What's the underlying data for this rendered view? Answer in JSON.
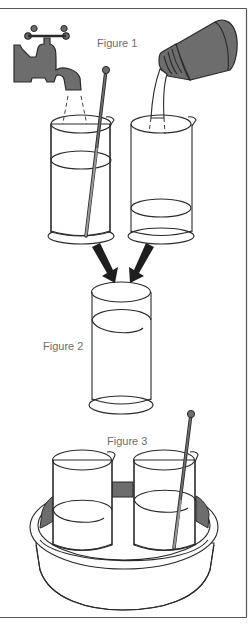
{
  "figure": {
    "labels": {
      "figure1": "Figure 1",
      "figure2": "Figure 2",
      "figure3": "Figure 3"
    },
    "colors": {
      "background": "#ffffff",
      "line": "#2a2a2a",
      "shaded": "#6d6d6d",
      "label_text": "#6e6e6e",
      "frame": "#555555"
    },
    "elements": {
      "figure1": [
        "tap-icon",
        "water-stream",
        "beaker-with-stirring-rod",
        "bottle-icon",
        "liquid-stream",
        "beaker-low-liquid"
      ],
      "arrows": [
        "arrow-left-to-cylinder",
        "arrow-right-to-cylinder"
      ],
      "figure2": [
        "measuring-cylinder"
      ],
      "figure3": [
        "water-bath-dish",
        "beaker-left",
        "beaker-right-with-stirring-rod"
      ]
    }
  }
}
